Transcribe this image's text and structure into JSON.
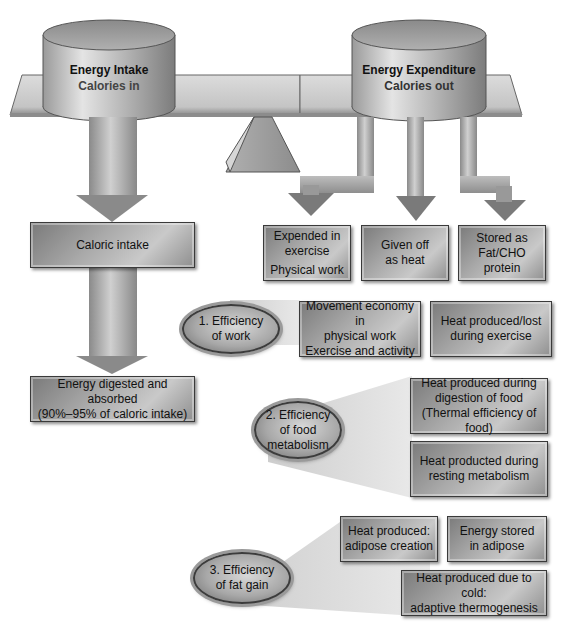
{
  "scale": {
    "left_container": {
      "title": "Energy Intake",
      "subtitle": "Calories in"
    },
    "right_container": {
      "title": "Energy Expenditure",
      "subtitle": "Calories out"
    }
  },
  "intake_flow": {
    "caloric_intake": "Caloric intake",
    "digested": {
      "line1": "Energy digested and absorbed",
      "line2": "(90%–95% of caloric intake)"
    }
  },
  "expenditure_outputs": [
    {
      "line1": "Expended in",
      "line2": "exercise",
      "line3": "Physical work"
    },
    {
      "line1": "Given off",
      "line2": "as heat"
    },
    {
      "line1": "Stored as",
      "line2": "Fat/CHO",
      "line3": "protein"
    }
  ],
  "efficiencies": [
    {
      "label_line1": "1. Efficiency",
      "label_line2": "of work",
      "boxes": [
        {
          "line1": "Movement economy in",
          "line2": "physical work",
          "line3": "Exercise and activity"
        },
        {
          "line1": "Heat produced/lost",
          "line2": "during exercise"
        }
      ]
    },
    {
      "label_line1": "2. Efficiency",
      "label_line2": "of food",
      "label_line3": "metabolism",
      "boxes": [
        {
          "line1": "Heat produced during",
          "line2": "digestion of food",
          "line3": "(Thermal efficiency of food)"
        },
        {
          "line1": "Heat producted during",
          "line2": "resting metabolism"
        }
      ]
    },
    {
      "label_line1": "3. Efficiency",
      "label_line2": "of fat gain",
      "boxes": [
        {
          "line1": "Heat produced:",
          "line2": "adipose creation"
        },
        {
          "line1": "Energy stored",
          "line2": "in adipose"
        },
        {
          "line1": "Heat produced due to cold:",
          "line2": "adaptive thermogenesis"
        }
      ]
    }
  ],
  "colors": {
    "box_dark": "#7a7a7a",
    "box_light": "#c9c9c9",
    "beam": "#c8c8c8",
    "text": "#111111",
    "subtitle_text": "#444444"
  }
}
